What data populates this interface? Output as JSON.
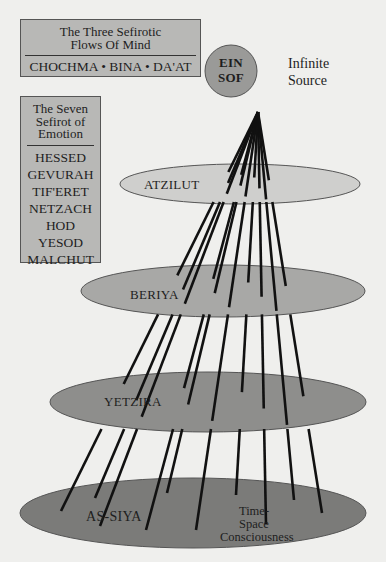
{
  "box_three": {
    "title_line1": "The Three Sefirotic",
    "title_line2": "Flows Of Mind",
    "items": "CHOCHMA • BINA • DA'AT"
  },
  "box_seven": {
    "title_line1": "The Seven",
    "title_line2": "Sefirot of",
    "title_line3": "Emotion",
    "items": [
      "HESSED",
      "GEVURAH",
      "TIF'ERET",
      "NETZACH",
      "HOD",
      "YESOD",
      "MALCHUT"
    ]
  },
  "source": {
    "circle_line1": "EIN",
    "circle_line2": "SOF",
    "label_line1": "Infinite",
    "label_line2": "Source"
  },
  "worlds": [
    {
      "name": "ATZILUT",
      "cx": 240,
      "cy": 184,
      "rx": 120,
      "ry": 20,
      "fill": "#cfcfcd"
    },
    {
      "name": "BERIYA",
      "cx": 223,
      "cy": 291,
      "rx": 142,
      "ry": 26,
      "fill": "#a8a8a6"
    },
    {
      "name": "YETZIRA",
      "cx": 208,
      "cy": 402,
      "rx": 158,
      "ry": 30,
      "fill": "#8e8e8c"
    },
    {
      "name": "AS-SIYA",
      "cx": 193,
      "cy": 513,
      "rx": 173,
      "ry": 35,
      "fill": "#7b7b79"
    }
  ],
  "assiya_note": {
    "line1": "Time-",
    "line2": "Space",
    "line3": "Consciousness"
  },
  "colors": {
    "background": "#efefed",
    "box": "#b8b8b6",
    "circle": "#9a9a98",
    "line": "#111111"
  },
  "rays": {
    "origin": [
      258,
      112
    ],
    "ends": [
      [
        61,
        511
      ],
      [
        95,
        498
      ],
      [
        100,
        526
      ],
      [
        146,
        530
      ],
      [
        167,
        493
      ],
      [
        196,
        530
      ],
      [
        236,
        495
      ],
      [
        266,
        524
      ],
      [
        294,
        500
      ],
      [
        322,
        513
      ]
    ]
  }
}
